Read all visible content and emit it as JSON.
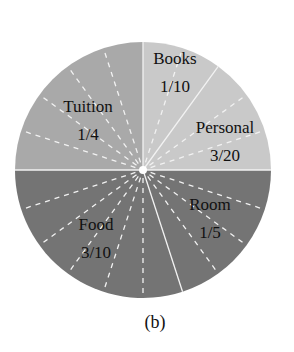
{
  "chart_data": {
    "type": "pie",
    "title": "",
    "caption": "(b)",
    "start_angle_deg": 0,
    "direction": "clockwise",
    "subdivisions": 20,
    "slices": [
      {
        "name": "Books",
        "fraction_label": "1/10",
        "value": 0.1,
        "color": "#c9c9c9",
        "label_pos": [
          175,
          58
        ]
      },
      {
        "name": "Personal",
        "fraction_label": "3/20",
        "value": 0.15,
        "color": "#c9c9c9",
        "label_pos": [
          225,
          127
        ]
      },
      {
        "name": "Room",
        "fraction_label": "1/5",
        "value": 0.2,
        "color": "#747474",
        "label_pos": [
          210,
          204
        ]
      },
      {
        "name": "Food",
        "fraction_label": "3/10",
        "value": 0.3,
        "color": "#747474",
        "label_pos": [
          96,
          224
        ]
      },
      {
        "name": "Tuition",
        "fraction_label": "1/4",
        "value": 0.25,
        "color": "#a9a9a9",
        "label_pos": [
          88,
          106
        ]
      }
    ],
    "legend": "none",
    "grid": false
  },
  "geometry": {
    "cx": 143,
    "cy": 170,
    "r": 128,
    "caption_pos": [
      155,
      328
    ]
  },
  "colors": {
    "line": "#f2f2f2",
    "text": "#111111"
  }
}
